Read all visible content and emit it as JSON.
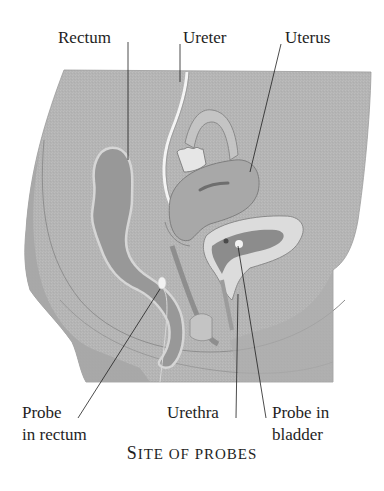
{
  "diagram": {
    "type": "anatomical cross-section (female pelvis, sagittal)",
    "caption": "Site of probes",
    "colors": {
      "background": "#ffffff",
      "tissue_base": "#b4b4b4",
      "tissue_dark": "#9c9c9c",
      "organ_fill": "#a8a8a8",
      "rectum_fill": "#989898",
      "bladder_wall_light": "#dcdcdc",
      "highlight": "#eeeeee",
      "outline": "#7d7d7d",
      "leader_line": "#1e1e1e",
      "text": "#1e1e1e"
    },
    "labels": {
      "rectum": "Rectum",
      "ureter": "Ureter",
      "uterus": "Uterus",
      "probe_rectum_line1": "Probe",
      "probe_rectum_line2": "in rectum",
      "urethra": "Urethra",
      "probe_bladder_line1": "Probe in",
      "probe_bladder_line2": "bladder"
    },
    "caption_parts": {
      "first_letter": "S",
      "rest_first_word": "ITE",
      "rest": "OF PROBES"
    },
    "structures": [
      "pelvic-body-section",
      "rectum",
      "ureter",
      "fallopian-tube-ovary",
      "uterus",
      "bladder",
      "urethra",
      "probe-in-rectum",
      "probe-in-bladder"
    ]
  }
}
